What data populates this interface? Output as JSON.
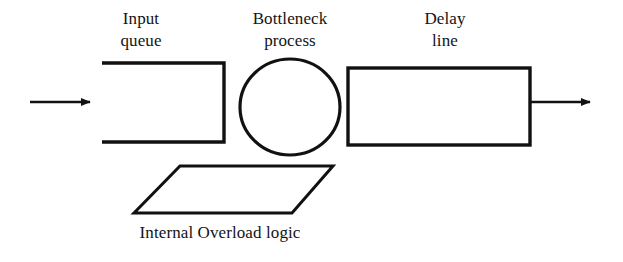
{
  "diagram": {
    "background_color": "#ffffff",
    "stroke_color": "#111111",
    "labels": {
      "input_queue": {
        "line1": "Input",
        "line2": "queue"
      },
      "bottleneck_process": {
        "line1": "Bottleneck",
        "line2": "process"
      },
      "delay_line": {
        "line1": "Delay",
        "line2": "line"
      },
      "internal_overload_logic": "Internal Overload logic"
    },
    "shapes": [
      {
        "name": "input-queue-open-rectangle",
        "type": "open-rectangle",
        "x": 102,
        "y": 62,
        "width": 123,
        "height": 81,
        "open_side": "left"
      },
      {
        "name": "bottleneck-process-ellipse",
        "type": "ellipse",
        "cx": 290,
        "cy": 107,
        "rx": 50,
        "ry": 48
      },
      {
        "name": "delay-line-rectangle",
        "type": "rectangle",
        "x": 348,
        "y": 68,
        "width": 182,
        "height": 77
      },
      {
        "name": "internal-overload-logic-parallelogram",
        "type": "parallelogram",
        "points": "180,166 333,166 292,213 134,213"
      }
    ],
    "arrows": [
      {
        "name": "input-arrow",
        "direction": "right",
        "x1": 30,
        "y1": 102,
        "x2": 92,
        "y2": 102
      },
      {
        "name": "output-arrow",
        "direction": "right",
        "x1": 530,
        "y1": 102,
        "x2": 592,
        "y2": 102
      }
    ]
  }
}
